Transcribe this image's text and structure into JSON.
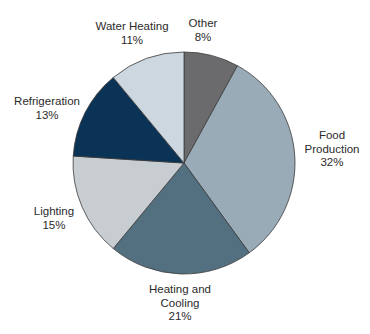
{
  "chart_data": {
    "type": "pie",
    "title": "",
    "start_angle_deg": 0,
    "direction": "clockwise",
    "center": [
      184,
      163
    ],
    "radius": 111,
    "categories": [
      "Other",
      "Food Production",
      "Heating and Cooling",
      "Lighting",
      "Refrigeration",
      "Water Heating"
    ],
    "values": [
      8,
      32,
      21,
      15,
      13,
      11
    ],
    "unit": "%",
    "slices": [
      {
        "label": "Other",
        "value": 8,
        "display": "8%",
        "color": "#6b6b6e",
        "label_lines": [
          "Other"
        ],
        "label_pos": [
          203,
          17
        ]
      },
      {
        "label": "Food Production",
        "value": 32,
        "display": "32%",
        "color": "#9aabb8",
        "label_lines": [
          "Food",
          "Production"
        ],
        "label_pos": [
          332,
          129
        ]
      },
      {
        "label": "Heating and Cooling",
        "value": 21,
        "display": "21%",
        "color": "#52707f",
        "label_lines": [
          "Heating and",
          "Cooling"
        ],
        "label_pos": [
          180,
          283
        ]
      },
      {
        "label": "Lighting",
        "value": 15,
        "display": "15%",
        "color": "#c8cdd2",
        "label_lines": [
          "Lighting"
        ],
        "label_pos": [
          54,
          205
        ]
      },
      {
        "label": "Refrigeration",
        "value": 13,
        "display": "13%",
        "color": "#0b3356",
        "label_lines": [
          "Refrigeration"
        ],
        "label_pos": [
          47,
          95
        ]
      },
      {
        "label": "Water Heating",
        "value": 11,
        "display": "11%",
        "color": "#cdd7df",
        "label_lines": [
          "Water Heating"
        ],
        "label_pos": [
          132,
          20
        ]
      }
    ],
    "stroke_color": "#3a3a3a",
    "legend": "none (inline labels)"
  }
}
